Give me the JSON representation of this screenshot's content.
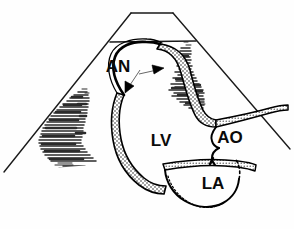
{
  "figure": {
    "kind": "echocardiographic-line-drawing",
    "background_color": "#fefefe",
    "ink_color": "#000000",
    "speckle_color": "#2b2b2b"
  },
  "sector": {
    "name": "ultrasound-sector-outline",
    "apex_top_left_x": 131,
    "apex_top_right_x": 173,
    "apex_top_y": 13,
    "near_field_line_y": 42,
    "near_field_left_x": 110,
    "near_field_right_x": 196,
    "base_left_x": 4,
    "base_left_y": 172,
    "base_right_x": 290,
    "base_right_y": 149
  },
  "labels": [
    {
      "id": "an",
      "text": "AN",
      "meaning": "aneurysm",
      "x": 118,
      "y": 72,
      "font_size": 17
    },
    {
      "id": "lv",
      "text": "LV",
      "meaning": "left ventricle",
      "x": 161,
      "y": 146,
      "font_size": 17
    },
    {
      "id": "ao",
      "text": "AO",
      "meaning": "aorta",
      "x": 230,
      "y": 143,
      "font_size": 17
    },
    {
      "id": "la",
      "text": "LA",
      "meaning": "left atrium",
      "x": 213,
      "y": 189,
      "font_size": 17
    }
  ],
  "arrows": [
    {
      "id": "arrow-left",
      "points_to": "thinned-aneurysm-neck-left",
      "tail_x": 137,
      "tail_y": 72,
      "tip_x": 125,
      "tip_y": 92,
      "direction": "down-left"
    },
    {
      "id": "arrow-right",
      "points_to": "thinned-aneurysm-wall-right",
      "tail_x": 140,
      "tail_y": 78,
      "tip_x": 163,
      "tip_y": 78,
      "direction": "right"
    }
  ],
  "structures": [
    {
      "id": "aneurysm-dome",
      "name": "apical-aneurysm-dome",
      "wall": "thin",
      "fill": "none"
    },
    {
      "id": "lv-wall",
      "name": "left-ventricular-wall",
      "wall": "thick-stippled",
      "fill": "stipple"
    },
    {
      "id": "aortic-root",
      "name": "aortic-root",
      "wall": "thin-stippled"
    },
    {
      "id": "aortic-valve",
      "name": "aortic-valve-cusps",
      "wall": "thin"
    },
    {
      "id": "left-atrium",
      "name": "left-atrial-cavity",
      "wall": "thin-partly-dashed"
    }
  ],
  "speckle_regions": [
    {
      "id": "speckle-upper-right",
      "name": "upper-right-tissue-speckle",
      "center_x": 196,
      "center_y": 80
    },
    {
      "id": "speckle-left",
      "name": "left-lateral-tissue-speckle",
      "center_x": 68,
      "center_y": 130
    },
    {
      "id": "speckle-lower",
      "name": "inferior-tissue-speckle",
      "center_x": 110,
      "center_y": 196
    }
  ]
}
